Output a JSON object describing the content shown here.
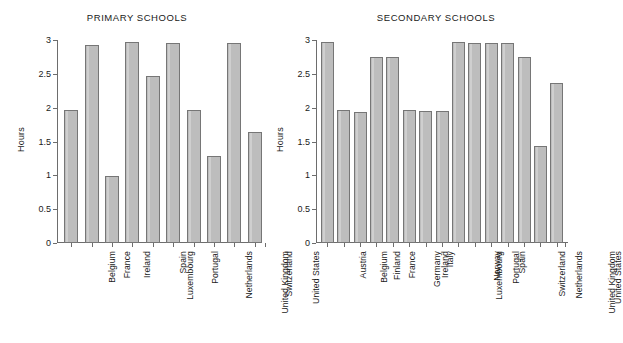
{
  "chart_data": [
    {
      "type": "bar",
      "title": "PRIMARY SCHOOLS",
      "xlabel": "",
      "ylabel": "Hours",
      "ylim": [
        0,
        3
      ],
      "yticks": [
        "0",
        "0.5",
        "1",
        "1.5",
        "2",
        "2.5",
        "3"
      ],
      "ytick_values": [
        0,
        0.5,
        1,
        1.5,
        2,
        2.5,
        3
      ],
      "grid": false,
      "legend": "none",
      "categories": [
        "Belgium",
        "France",
        "Ireland",
        "Luxembourg",
        "Spain",
        "Portugal",
        "Netherlands",
        "United Kingdom",
        "Switzerland",
        "United States"
      ],
      "values": [
        1.96,
        2.93,
        0.99,
        2.97,
        2.47,
        2.96,
        1.96,
        1.28,
        2.95,
        1.64
      ]
    },
    {
      "type": "bar",
      "title": "SECONDARY SCHOOLS",
      "xlabel": "",
      "ylabel": "Hours",
      "ylim": [
        0,
        3
      ],
      "yticks": [
        "0",
        "0.5",
        "1",
        "1.5",
        "2",
        "2.5",
        "3"
      ],
      "ytick_values": [
        0,
        0.5,
        1,
        1.5,
        2,
        2.5,
        3
      ],
      "grid": false,
      "legend": "none",
      "categories": [
        "Austria",
        "Belgium",
        "Finland",
        "France",
        "Germany",
        "Ireland",
        "Italy",
        "Luxembourg",
        "Norway",
        "Portugal",
        "Spain",
        "Switzerland",
        "Netherlands",
        "United Kingdom",
        "United States"
      ],
      "values": [
        2.97,
        1.97,
        1.94,
        2.75,
        2.75,
        1.96,
        1.95,
        1.95,
        2.97,
        2.95,
        2.95,
        2.95,
        2.75,
        1.44,
        2.37
      ]
    }
  ],
  "colors": {
    "bar_fill": "#bdbdbd",
    "bar_edge": "#767676",
    "axis": "#6d6d6d",
    "text": "#1a1a1a",
    "background": "#ffffff"
  }
}
